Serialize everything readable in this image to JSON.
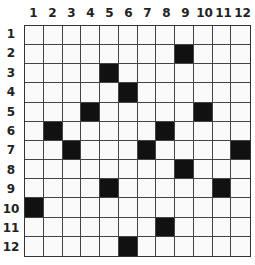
{
  "puzzle": {
    "rows": 12,
    "cols": 12,
    "column_labels": [
      "1",
      "2",
      "3",
      "4",
      "5",
      "6",
      "7",
      "8",
      "9",
      "10",
      "11",
      "12"
    ],
    "row_labels": [
      "1",
      "2",
      "3",
      "4",
      "5",
      "6",
      "7",
      "8",
      "9",
      "10",
      "11",
      "12"
    ],
    "filled_cells": [
      [
        2,
        9
      ],
      [
        3,
        5
      ],
      [
        4,
        6
      ],
      [
        5,
        4
      ],
      [
        5,
        10
      ],
      [
        6,
        2
      ],
      [
        6,
        8
      ],
      [
        7,
        3
      ],
      [
        7,
        7
      ],
      [
        7,
        12
      ],
      [
        8,
        9
      ],
      [
        9,
        5
      ],
      [
        9,
        11
      ],
      [
        10,
        1
      ],
      [
        11,
        8
      ],
      [
        12,
        6
      ]
    ],
    "colors": {
      "filled": "#111111",
      "empty": "#fafafa",
      "line": "#444444"
    }
  }
}
